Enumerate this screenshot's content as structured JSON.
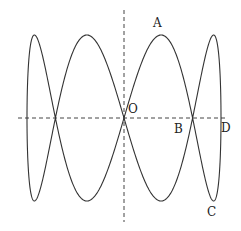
{
  "figure": {
    "type": "lissajous-curve",
    "center": {
      "x": 124,
      "y": 118
    },
    "amplitude_x": 97,
    "amplitude_y": 83,
    "frequency_ratio": "1:4",
    "curve_color": "#333333",
    "axis_color": "#444444"
  },
  "axes": {
    "horizontal": {
      "x1": 18,
      "x2": 228,
      "y": 118
    },
    "vertical": {
      "x": 124,
      "y1": 10,
      "y2": 222
    }
  },
  "labels": {
    "A": {
      "text": "A",
      "x": 153,
      "y": 27
    },
    "O": {
      "text": "O",
      "x": 128,
      "y": 113
    },
    "B": {
      "text": "B",
      "x": 174,
      "y": 133
    },
    "D": {
      "text": "D",
      "x": 221,
      "y": 132
    },
    "C": {
      "text": "C",
      "x": 207,
      "y": 216
    }
  }
}
